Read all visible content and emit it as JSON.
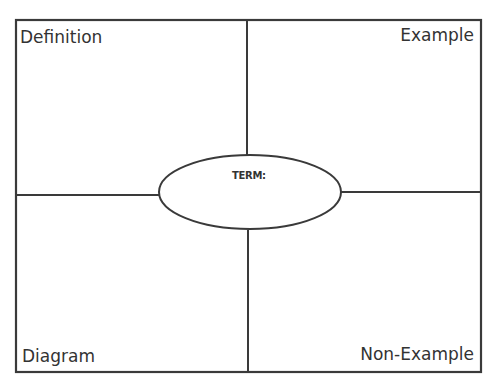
{
  "organizer": {
    "type": "Frayer model",
    "quadrants": {
      "top_left": "Definition",
      "top_right": "Example",
      "bottom_left": "Diagram",
      "bottom_right": "Non-Example"
    },
    "center": {
      "label": "TERM:"
    },
    "colors": {
      "line": "#3a3a3a",
      "text": "#333333",
      "background": "#ffffff"
    }
  }
}
